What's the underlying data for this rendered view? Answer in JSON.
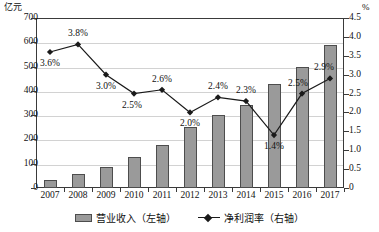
{
  "chart_data": {
    "type": "bar",
    "title": "",
    "subtitle": "",
    "xlabel": "",
    "ylabel": "亿元",
    "ylabel_right": "%",
    "categories": [
      "2007",
      "2008",
      "2009",
      "2010",
      "2011",
      "2012",
      "2013",
      "2014",
      "2015",
      "2016",
      "2017"
    ],
    "grid": true,
    "legend_position": "bottom",
    "ylim": [
      0,
      700
    ],
    "ylim_right": [
      0,
      4.5
    ],
    "yticks": [
      "0",
      "100",
      "200",
      "300",
      "400",
      "500",
      "600",
      "700"
    ],
    "yticks_right": [
      "0",
      "0.5",
      "1.0",
      "1.5",
      "2.0",
      "2.5",
      "3.0",
      "3.5",
      "4.0",
      "4.5"
    ],
    "series": [
      {
        "name": "营业收入（左轴）",
        "type": "bar",
        "axis": "left",
        "color": "#9a9a9a",
        "values": [
          35,
          58,
          88,
          126,
          178,
          250,
          300,
          340,
          430,
          500,
          590
        ]
      },
      {
        "name": "净利润率（右轴）",
        "type": "line",
        "axis": "right",
        "color": "#1a1a1a",
        "values": [
          3.6,
          3.8,
          3.0,
          2.5,
          2.6,
          2.0,
          2.4,
          2.3,
          1.4,
          2.5,
          2.9
        ],
        "point_labels": [
          "3.6%",
          "3.8%",
          "3.0%",
          "2.5%",
          "2.6%",
          "2.0%",
          "2.4%",
          "2.3%",
          "1.4%",
          "2.5%",
          "2.9%"
        ]
      }
    ]
  },
  "legend": {
    "items": [
      {
        "label": "营业收入（左轴）",
        "marker": "bar-swatch"
      },
      {
        "label": "净利润率（右轴）",
        "marker": "line-diamond-swatch"
      }
    ]
  },
  "axes": {
    "left_unit": "亿元",
    "right_unit": "%"
  }
}
